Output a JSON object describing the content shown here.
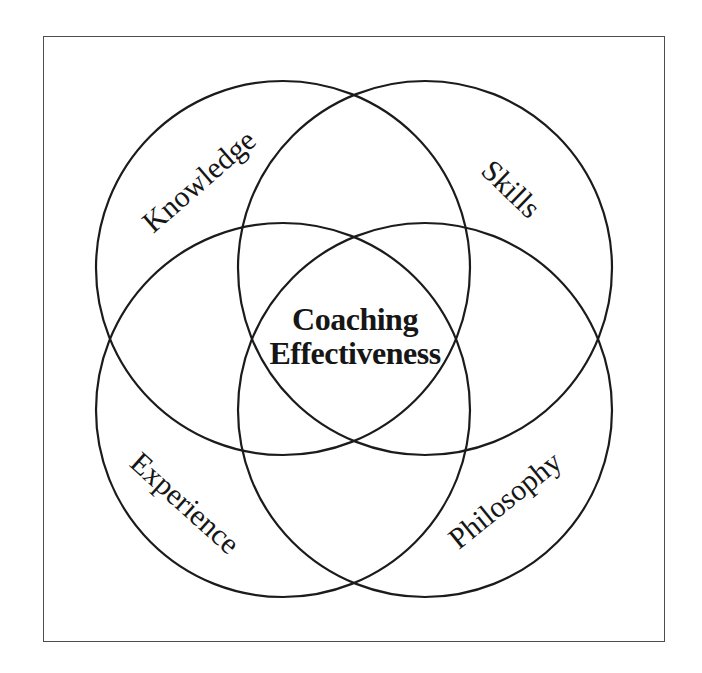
{
  "diagram": {
    "type": "venn",
    "center": {
      "line1": "Coaching",
      "line2": "Effectiveness"
    },
    "circles": [
      {
        "id": "knowledge",
        "label": "Knowledge",
        "position": "top-left"
      },
      {
        "id": "skills",
        "label": "Skills",
        "position": "top-right"
      },
      {
        "id": "experience",
        "label": "Experience",
        "position": "bottom-left"
      },
      {
        "id": "philosophy",
        "label": "Philosophy",
        "position": "bottom-right"
      }
    ],
    "colors": {
      "line": "#1b1b1b",
      "frame": "#4d4d4d",
      "background": "#ffffff",
      "text": "#161616"
    }
  }
}
